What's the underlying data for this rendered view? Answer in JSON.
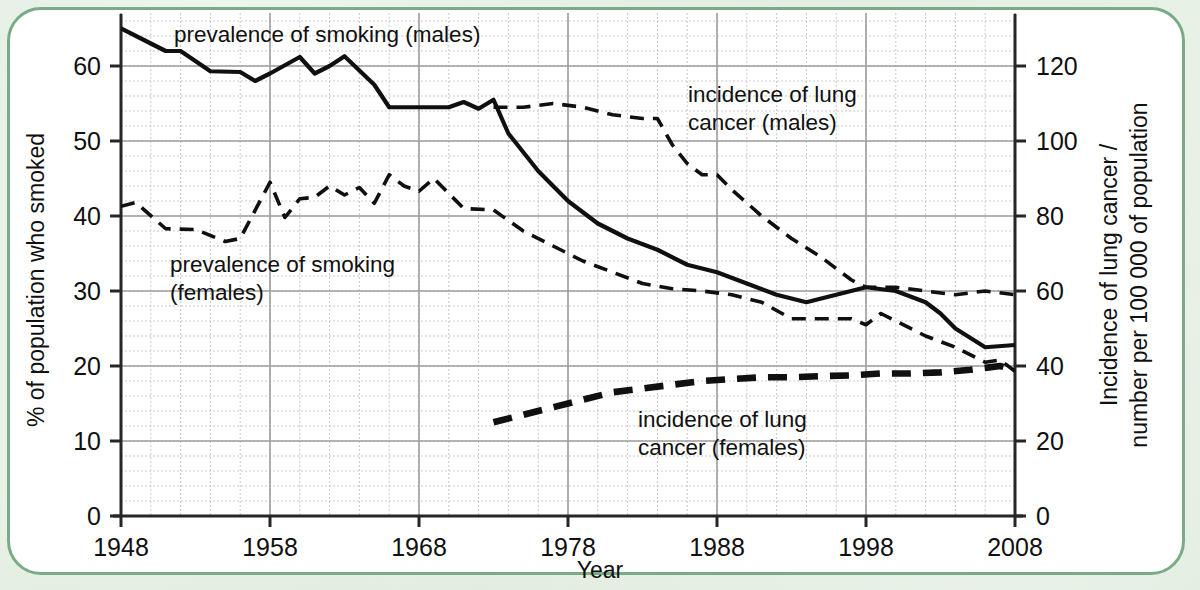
{
  "figure": {
    "background_color": "#dfeade",
    "panel_color": "#ffffff",
    "panel_border_color": "#79ab86"
  },
  "axes": {
    "x_title": "Year",
    "y_left_title": "% of population who smoked",
    "y_right_title_line1": "Incidence of lung cancer /",
    "y_right_title_line2": "number per 100 000 of population",
    "x_ticks": [
      "1948",
      "1958",
      "1968",
      "1978",
      "1988",
      "1998",
      "2008"
    ],
    "y_left_ticks": [
      "0",
      "10",
      "20",
      "30",
      "40",
      "50",
      "60"
    ],
    "y_right_ticks": [
      "0",
      "20",
      "40",
      "60",
      "80",
      "100",
      "120"
    ]
  },
  "labels": {
    "smoking_males": "prevalence of smoking (males)",
    "smoking_females_l1": "prevalence of smoking",
    "smoking_females_l2": "(females)",
    "lung_males_l1": "incidence of lung",
    "lung_males_l2": "cancer (males)",
    "lung_females_l1": "incidence of lung",
    "lung_females_l2": "cancer (females)"
  },
  "chart_data": {
    "type": "line",
    "title": "",
    "xlabel": "Year",
    "ylabel": "% of population who smoked",
    "y2label": "Incidence of lung cancer / number per 100 000 of population",
    "xlim": [
      1948,
      2008
    ],
    "ylim": [
      0,
      65
    ],
    "y2lim": [
      0,
      130
    ],
    "grid": true,
    "legend": "inline annotations",
    "series": [
      {
        "name": "prevalence of smoking (males)",
        "axis": "left",
        "style": "solid",
        "unit": "% of population who smoked",
        "points": [
          [
            1948,
            65.0
          ],
          [
            1950,
            63.0
          ],
          [
            1951,
            62.0
          ],
          [
            1952,
            62.0
          ],
          [
            1954,
            59.3
          ],
          [
            1956,
            59.2
          ],
          [
            1957,
            58.0
          ],
          [
            1958,
            59.0
          ],
          [
            1960,
            61.2
          ],
          [
            1961,
            59.0
          ],
          [
            1962,
            60.0
          ],
          [
            1963,
            61.3
          ],
          [
            1965,
            57.5
          ],
          [
            1966,
            54.5
          ],
          [
            1968,
            54.5
          ],
          [
            1970,
            54.5
          ],
          [
            1971,
            55.2
          ],
          [
            1972,
            54.3
          ],
          [
            1973,
            55.5
          ],
          [
            1974,
            51.0
          ],
          [
            1976,
            46.0
          ],
          [
            1978,
            42.0
          ],
          [
            1980,
            39.0
          ],
          [
            1982,
            37.0
          ],
          [
            1984,
            35.5
          ],
          [
            1986,
            33.5
          ],
          [
            1988,
            32.5
          ],
          [
            1990,
            31.0
          ],
          [
            1992,
            29.5
          ],
          [
            1994,
            28.5
          ],
          [
            1996,
            29.5
          ],
          [
            1998,
            30.5
          ],
          [
            2000,
            30.0
          ],
          [
            2002,
            28.5
          ],
          [
            2003,
            27.0
          ],
          [
            2004,
            25.0
          ],
          [
            2006,
            22.5
          ],
          [
            2008,
            22.8
          ]
        ]
      },
      {
        "name": "prevalence of smoking (females)",
        "axis": "left",
        "style": "dashed",
        "unit": "% of population who smoked",
        "points": [
          [
            1948,
            41.3
          ],
          [
            1949,
            41.8
          ],
          [
            1951,
            38.3
          ],
          [
            1953,
            38.2
          ],
          [
            1955,
            36.6
          ],
          [
            1956,
            37.0
          ],
          [
            1958,
            44.5
          ],
          [
            1959,
            39.8
          ],
          [
            1960,
            42.3
          ],
          [
            1961,
            42.5
          ],
          [
            1962,
            44.0
          ],
          [
            1963,
            42.8
          ],
          [
            1964,
            43.8
          ],
          [
            1965,
            41.7
          ],
          [
            1966,
            45.5
          ],
          [
            1967,
            44.0
          ],
          [
            1968,
            43.3
          ],
          [
            1969,
            45.0
          ],
          [
            1970,
            43.0
          ],
          [
            1971,
            41.0
          ],
          [
            1973,
            40.8
          ],
          [
            1975,
            38.0
          ],
          [
            1977,
            36.0
          ],
          [
            1979,
            34.0
          ],
          [
            1981,
            32.5
          ],
          [
            1983,
            31.0
          ],
          [
            1985,
            30.3
          ],
          [
            1987,
            30.0
          ],
          [
            1989,
            29.5
          ],
          [
            1991,
            28.5
          ],
          [
            1993,
            26.3
          ],
          [
            1995,
            26.3
          ],
          [
            1997,
            26.3
          ],
          [
            1998,
            25.5
          ],
          [
            1999,
            27.0
          ],
          [
            2000,
            26.0
          ],
          [
            2002,
            24.0
          ],
          [
            2004,
            22.5
          ],
          [
            2006,
            20.5
          ],
          [
            2007,
            20.8
          ],
          [
            2008,
            19.3
          ]
        ]
      },
      {
        "name": "incidence of lung cancer (males)",
        "axis": "right",
        "style": "dashed",
        "unit": "number per 100 000 of population",
        "points": [
          [
            1973,
            109
          ],
          [
            1975,
            109
          ],
          [
            1977,
            110
          ],
          [
            1979,
            109
          ],
          [
            1981,
            107
          ],
          [
            1983,
            106
          ],
          [
            1984,
            106
          ],
          [
            1985,
            99
          ],
          [
            1986,
            94
          ],
          [
            1987,
            91
          ],
          [
            1988,
            91
          ],
          [
            1989,
            87
          ],
          [
            1991,
            80
          ],
          [
            1993,
            74
          ],
          [
            1995,
            69
          ],
          [
            1997,
            63
          ],
          [
            1998,
            61
          ],
          [
            2000,
            61
          ],
          [
            2002,
            60
          ],
          [
            2004,
            59
          ],
          [
            2006,
            60
          ],
          [
            2008,
            59
          ]
        ]
      },
      {
        "name": "incidence of lung cancer (females)",
        "axis": "right",
        "style": "thick-dashed",
        "unit": "number per 100 000 of population",
        "points": [
          [
            1973,
            25
          ],
          [
            1975,
            27
          ],
          [
            1977,
            29
          ],
          [
            1979,
            31
          ],
          [
            1981,
            33
          ],
          [
            1983,
            34
          ],
          [
            1985,
            35
          ],
          [
            1987,
            36
          ],
          [
            1989,
            36.5
          ],
          [
            1991,
            37
          ],
          [
            1993,
            37
          ],
          [
            1995,
            37.3
          ],
          [
            1997,
            37.5
          ],
          [
            1999,
            38
          ],
          [
            2001,
            38
          ],
          [
            2003,
            38.3
          ],
          [
            2005,
            39
          ],
          [
            2006,
            39.5
          ],
          [
            2007,
            40
          ],
          [
            2008,
            39
          ]
        ]
      }
    ]
  }
}
